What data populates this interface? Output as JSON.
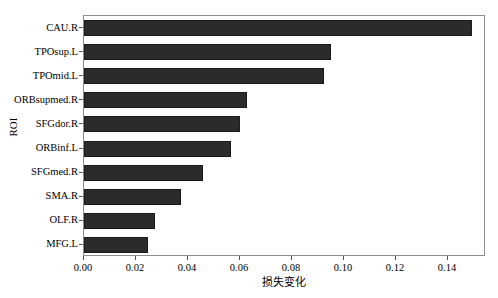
{
  "chart_data": {
    "type": "bar",
    "orientation": "horizontal",
    "title": "",
    "xlabel": "损失变化",
    "ylabel": "ROI",
    "categories": [
      "CAU.R",
      "TPOsup.L",
      "TPOmid.L",
      "ORBsupmed.R",
      "SFGdor.R",
      "ORBinf.L",
      "SFGmed.R",
      "SMA.R",
      "OLF.R",
      "MFG.L"
    ],
    "values": [
      0.1492,
      0.0948,
      0.0923,
      0.0628,
      0.0601,
      0.0567,
      0.0456,
      0.0372,
      0.0273,
      0.0246
    ],
    "xlim": [
      0.0,
      0.1546
    ],
    "ylim_categories": 10,
    "xticks": [
      0.0,
      0.02,
      0.04,
      0.06,
      0.08,
      0.1,
      0.12,
      0.14
    ],
    "xticklabels": [
      "0.00",
      "0.02",
      "0.04",
      "0.06",
      "0.08",
      "0.10",
      "0.12",
      "0.14"
    ],
    "grid": false,
    "legend": null,
    "bar_color": "#2b2b2b",
    "bar_edge_color": "#1a1a1a",
    "frame_color": "#8d8d8d",
    "background": "#ffffff"
  },
  "axes": {
    "x_axis_name": "x-axis",
    "y_axis_name": "y-axis"
  }
}
